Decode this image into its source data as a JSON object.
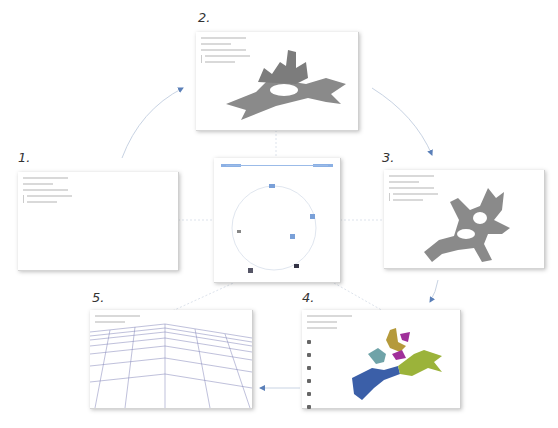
{
  "steps": [
    {
      "number": "1.",
      "title": "Empty workspace"
    },
    {
      "number": "2.",
      "title": "Grey 3D mesh model"
    },
    {
      "number": "3.",
      "title": "Grey 3D mesh model (rotated)"
    },
    {
      "number": "4.",
      "title": "Segmented colored mesh"
    },
    {
      "number": "5.",
      "title": "Wireframe terrain view"
    }
  ],
  "center": {
    "header_left": "",
    "header_right": "",
    "graph_nodes": 6
  },
  "panel4_legend_rows": 6,
  "colors": {
    "accent": "#5a8fd8",
    "mesh_grey": "#8a8a8a",
    "segment_blue": "#3b5fa8",
    "segment_green": "#9bb33a",
    "segment_teal": "#6fa3a8",
    "segment_gold": "#b59a3b",
    "segment_magenta": "#a0309a",
    "wireframe": "#4a4f9a"
  }
}
